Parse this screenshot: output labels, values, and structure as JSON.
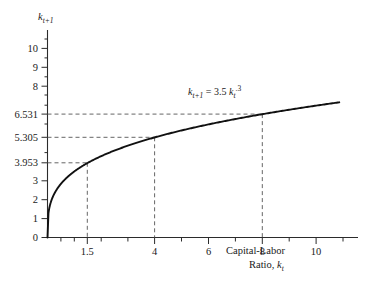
{
  "chart_data": {
    "type": "line",
    "title": "",
    "subtitle": "",
    "xlabel_line1": "Capital-Labor",
    "xlabel_line2_prefix": "Ratio, ",
    "xlabel_var": "k",
    "xlabel_var_sub": "t",
    "ylabel_var": "k",
    "ylabel_var_sub": "t+1",
    "equation": {
      "lhs_var": "k",
      "lhs_sub": "t+1",
      "equals": "=",
      "coefficient": "3.5",
      "rhs_var": "k",
      "rhs_sub": "t",
      "rhs_sup": ".3",
      "full_text": "k_{t+1} = 3.5 k_t^.3"
    },
    "function": "k_{t+1} = 3.5 * k_t^0.3",
    "coefficient": 3.5,
    "exponent": 0.3,
    "xlim": [
      0,
      11.6
    ],
    "ylim": [
      0,
      11.0
    ],
    "grid": false,
    "legend_position": "none",
    "x_major_ticks": [
      1.5,
      4,
      6,
      8,
      10
    ],
    "x_major_tick_labels": [
      "1.5",
      "4",
      "6",
      "8",
      "10"
    ],
    "x_minor_ticks": [
      0.5,
      1,
      2,
      3,
      5,
      7,
      9,
      11
    ],
    "y_major_ticks": [
      0,
      1,
      2,
      3,
      3.953,
      5.305,
      6.531,
      8,
      9,
      10
    ],
    "y_major_tick_labels": [
      "0",
      "1",
      "2",
      "3",
      "3.953",
      "5.305",
      "6.531",
      "8",
      "9",
      "10"
    ],
    "y_minor_ticks": [
      4.5,
      6,
      7
    ],
    "highlight_points": [
      {
        "x": 1.5,
        "y": 3.953
      },
      {
        "x": 4,
        "y": 5.305
      },
      {
        "x": 8,
        "y": 6.531
      }
    ],
    "x": [
      0.05,
      0.1,
      0.2,
      0.3,
      0.4,
      0.5,
      0.6,
      0.8,
      1.0,
      1.25,
      1.5,
      1.75,
      2.0,
      2.5,
      3.0,
      3.5,
      4.0,
      4.5,
      5.0,
      5.5,
      6.0,
      6.5,
      7.0,
      7.5,
      8.0,
      8.5,
      9.0,
      9.5,
      10.0,
      10.5
    ],
    "values": [
      1.176,
      1.448,
      1.783,
      2.015,
      2.196,
      2.345,
      2.473,
      2.688,
      2.863,
      3.048,
      3.953,
      3.345,
      3.462,
      3.667,
      3.838,
      3.985,
      5.305,
      4.231,
      4.338,
      4.436,
      4.528,
      4.613,
      4.693,
      4.769,
      6.531,
      4.908,
      4.973,
      5.035,
      5.095,
      5.152
    ]
  },
  "figure": {
    "caption": ""
  }
}
